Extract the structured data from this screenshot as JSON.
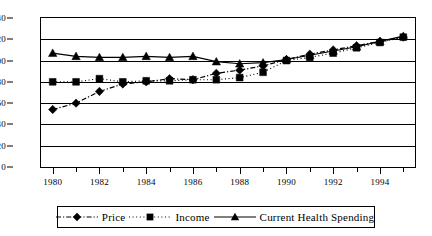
{
  "chart_data": {
    "type": "line",
    "title": "",
    "subtitle": "",
    "xlabel": "",
    "ylabel": "",
    "xlim": [
      1979.5,
      1995.5
    ],
    "ylim": [
      0,
      140
    ],
    "grid": true,
    "legend_position": "bottom",
    "x": [
      1980,
      1981,
      1982,
      1983,
      1984,
      1985,
      1986,
      1987,
      1988,
      1989,
      1990,
      1991,
      1992,
      1993,
      1994,
      1995
    ],
    "xticks_major": [
      1980,
      1982,
      1984,
      1986,
      1988,
      1990,
      1992,
      1994
    ],
    "xtick_labels": [
      "1980",
      "1982",
      "1984",
      "1986",
      "1988",
      "1990",
      "1992",
      "1994"
    ],
    "yticks": [
      0,
      20,
      40,
      60,
      80,
      100,
      120,
      140
    ],
    "ytick_labels": [
      "0",
      "20",
      "40",
      "60",
      "80",
      "100",
      "120",
      "140"
    ],
    "series": [
      {
        "name": "Price",
        "marker": "diamond",
        "linestyle": "dash-dot",
        "color": "#000000",
        "values": [
          54,
          60,
          71,
          78,
          80,
          83,
          82,
          88,
          91,
          95,
          101,
          106,
          110,
          114,
          118,
          122
        ]
      },
      {
        "name": "Income",
        "marker": "square",
        "linestyle": "dotted",
        "color": "#000000",
        "values": [
          80,
          80,
          83,
          80,
          81,
          81,
          82,
          82,
          84,
          89,
          100,
          103,
          107,
          112,
          117,
          122
        ]
      },
      {
        "name": "Current Health Spending",
        "marker": "triangle",
        "linestyle": "solid",
        "color": "#000000",
        "values": [
          107,
          104,
          103,
          103,
          104,
          103,
          104,
          99,
          97,
          98,
          101,
          105,
          109,
          113,
          118,
          123
        ]
      }
    ]
  },
  "legend": {
    "entries": [
      {
        "label": "Price",
        "icon": "diamond-marker-icon"
      },
      {
        "label": "Income",
        "icon": "square-marker-icon"
      },
      {
        "label": "Current Health Spending",
        "icon": "triangle-marker-icon"
      }
    ]
  }
}
